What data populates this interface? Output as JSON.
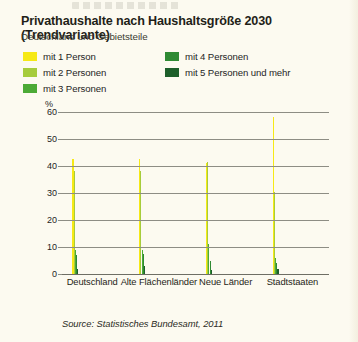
{
  "header": {
    "title": "Privathaushalte nach Haushaltsgröße 2030 (Trendvariante)",
    "subtitle": "Deutschland und Gebietsteile"
  },
  "legend": {
    "column_left": [
      {
        "label": "mit 1 Person",
        "color": "#f6e916"
      },
      {
        "label": "mit 2 Personen",
        "color": "#a6cc3c"
      },
      {
        "label": "mit 3 Personen",
        "color": "#4caa36"
      }
    ],
    "column_right": [
      {
        "label": "mit 4 Personen",
        "color": "#2f8a33"
      },
      {
        "label": "mit 5 Personen und mehr",
        "color": "#1d5f2a"
      }
    ]
  },
  "axis": {
    "unit": "%",
    "yticks": [
      "60",
      "50",
      "40",
      "30",
      "20",
      "10",
      "0"
    ]
  },
  "source": "Source: Statistisches Bundesamt, 2011",
  "chart_data": {
    "type": "bar",
    "title": "Privathaushalte nach Haushaltsgröße 2030 (Trendvariante)",
    "subtitle": "Deutschland und Gebietsteile",
    "xlabel": "",
    "ylabel": "%",
    "ylim": [
      0,
      60
    ],
    "yticks": [
      0,
      10,
      20,
      30,
      40,
      50,
      60
    ],
    "grid": true,
    "legend_position": "top",
    "categories": [
      "Deutschland",
      "Alte Flächenländer",
      "Neue Länder",
      "Stadtstaaten"
    ],
    "series": [
      {
        "name": "mit 1 Person",
        "color": "#f6e916",
        "values": [
          42.5,
          42.5,
          41.0,
          58.0
        ]
      },
      {
        "name": "mit 2 Personen",
        "color": "#a6cc3c",
        "values": [
          38.0,
          38.0,
          41.5,
          30.5
        ]
      },
      {
        "name": "mit 3 Personen",
        "color": "#4caa36",
        "values": [
          9.0,
          9.0,
          11.0,
          6.0
        ]
      },
      {
        "name": "mit 4 Personen",
        "color": "#2f8a33",
        "values": [
          7.0,
          7.5,
          5.0,
          4.0
        ]
      },
      {
        "name": "mit 5 Personen und mehr",
        "color": "#1d5f2a",
        "values": [
          2.0,
          3.0,
          1.5,
          2.0
        ]
      }
    ],
    "annotation": "Source: Statistisches Bundesamt, 2011"
  }
}
